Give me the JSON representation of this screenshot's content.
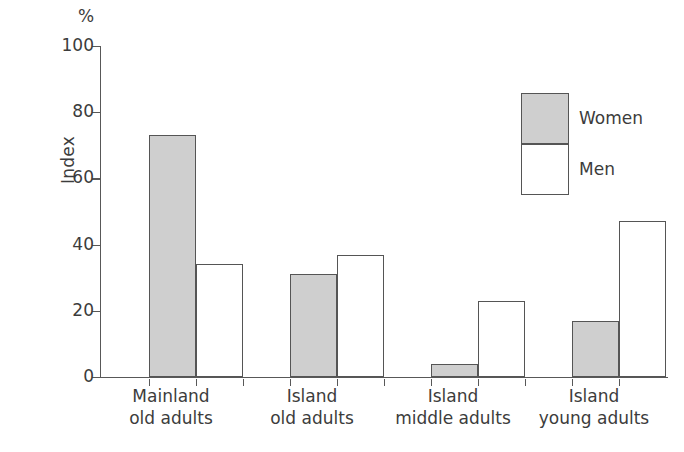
{
  "chart_data": {
    "type": "bar",
    "title": "",
    "subtitle": "",
    "xlabel": "",
    "ylabel": "Index",
    "unit_label": "%",
    "ylim": [
      0,
      100
    ],
    "yticks": [
      0,
      20,
      40,
      60,
      80,
      100
    ],
    "grid": false,
    "legend_position": "top-right",
    "categories": [
      "Mainland old adults",
      "Island old adults",
      "Island middle adults",
      "Island young adults"
    ],
    "category_lines": [
      {
        "line1": "Mainland",
        "line2": "old adults"
      },
      {
        "line1": "Island",
        "line2": "old adults"
      },
      {
        "line1": "Island",
        "line2": "middle adults"
      },
      {
        "line1": "Island",
        "line2": "young adults"
      }
    ],
    "series": [
      {
        "name": "Women",
        "color": "#cfcfcf",
        "values": [
          73,
          31,
          4,
          17
        ]
      },
      {
        "name": "Men",
        "color": "#ffffff",
        "values": [
          34,
          37,
          23,
          47
        ]
      }
    ]
  },
  "legend": {
    "women_label": "Women",
    "men_label": "Men"
  },
  "axis": {
    "y_title": "Index",
    "percent_symbol": "%",
    "tick_100": "100",
    "tick_80": "80",
    "tick_60": "60",
    "tick_40": "40",
    "tick_20": "20",
    "tick_0": "0"
  }
}
